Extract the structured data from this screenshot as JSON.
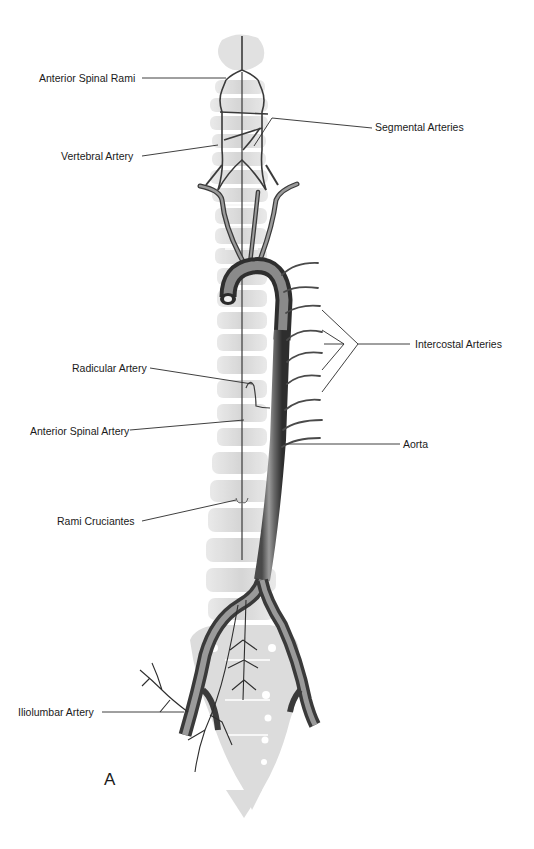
{
  "figure": {
    "panel_letter": "A",
    "labels": {
      "anterior_spinal_rami": "Anterior Spinal Rami",
      "segmental_arteries": "Segmental Arteries",
      "vertebral_artery": "Vertebral Artery",
      "intercostal_arteries": "Intercostal Arteries",
      "radicular_artery": "Radicular Artery",
      "anterior_spinal_artery": "Anterior Spinal Artery",
      "aorta": "Aorta",
      "rami_cruciantes": "Rami Cruciantes",
      "iliolumbar_artery": "Iliolumbar Artery"
    },
    "colors": {
      "vertebra": "#d9d9d9",
      "vertebra_light": "#ececec",
      "artery_dark": "#3a3a3a",
      "artery_mid": "#6e6e6e",
      "artery_light": "#a8a8a8",
      "leader_line": "#2a2a2a"
    }
  }
}
